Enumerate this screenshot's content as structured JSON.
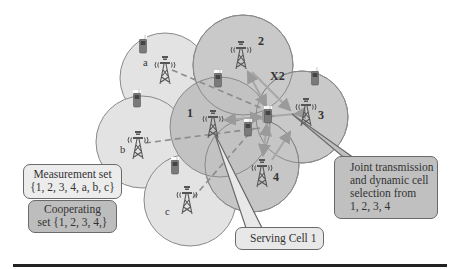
{
  "diagram": {
    "colors": {
      "outer_cell_fill": "#e3e3e3",
      "cooperating_cell_fill": "#c4c4c4",
      "cell_stroke": "#8a8a8a",
      "arrow": "#a6a6a6",
      "dashed_line": "#8c8c8c",
      "callout_light": "#ececec",
      "callout_dark": "#bdbdbd",
      "rule": "#222222"
    },
    "cells": [
      {
        "id": "a",
        "label": "a",
        "type": "measurement-only"
      },
      {
        "id": "b",
        "label": "b",
        "type": "measurement-only"
      },
      {
        "id": "c",
        "label": "c",
        "type": "measurement-only"
      },
      {
        "id": "1",
        "label": "1",
        "type": "cooperating",
        "role": "serving"
      },
      {
        "id": "2",
        "label": "2",
        "type": "cooperating"
      },
      {
        "id": "3",
        "label": "3",
        "type": "cooperating"
      },
      {
        "id": "4",
        "label": "4",
        "type": "cooperating"
      }
    ],
    "interface_label": "X2",
    "callouts": {
      "measurement_set": {
        "line1": "Measurement set",
        "line2": "{1, 2, 3, 4, a, b, c}"
      },
      "cooperating_set": {
        "line1": "Cooperating",
        "line2": "set {1, 2, 3, 4,}"
      },
      "joint_transmission": {
        "line1": "Joint transmission",
        "line2": "and dynamic cell",
        "line3": "selection from",
        "line4": "1, 2, 3, 4"
      },
      "serving_cell": {
        "line1": "Serving Cell 1"
      }
    }
  }
}
